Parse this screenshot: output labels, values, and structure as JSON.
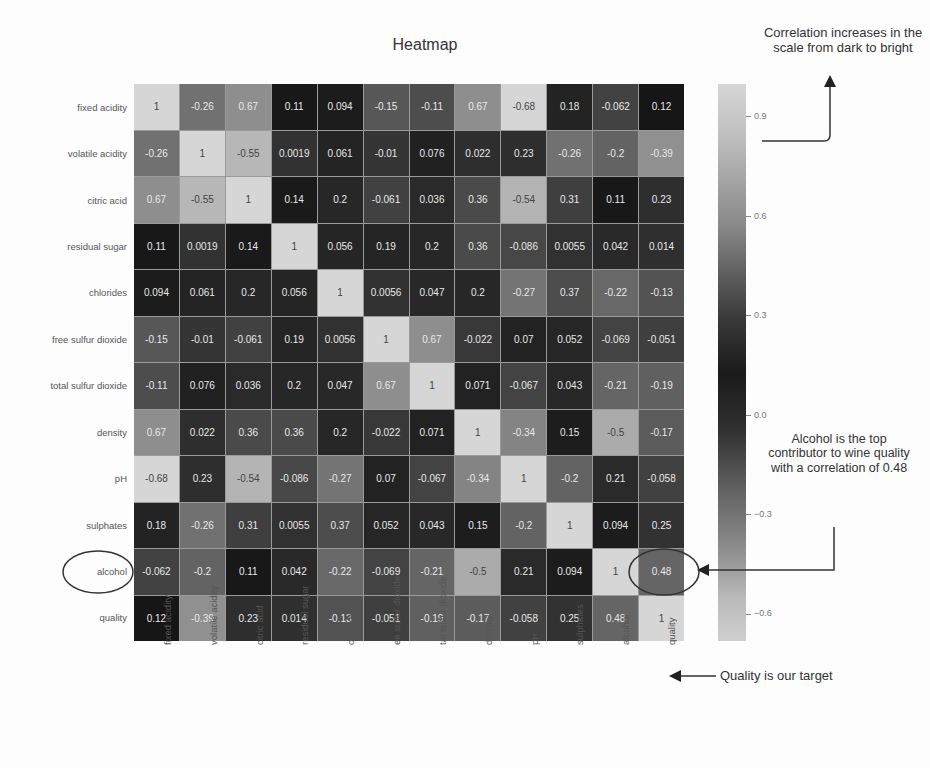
{
  "chart_data": {
    "type": "heatmap",
    "title": "Heatmap",
    "xlabel": "",
    "ylabel": "",
    "row_labels": [
      "fixed acidity",
      "volatile acidity",
      "citric acid",
      "residual sugar",
      "chlorides",
      "free sulfur dioxide",
      "total sulfur dioxide",
      "density",
      "pH",
      "sulphates",
      "alcohol",
      "quality"
    ],
    "col_labels": [
      "fixed acidity",
      "volatile acidity",
      "citric acid",
      "residual sugar",
      "chlorides",
      "ee sulfur dioxide",
      "tal sulfur dioxide",
      "density",
      "pH",
      "sulphates",
      "alcohol",
      "quality"
    ],
    "values": [
      [
        "1",
        "-0.26",
        "0.67",
        "0.11",
        "0.094",
        "-0.15",
        "-0.11",
        "0.67",
        "-0.68",
        "0.18",
        "-0.062",
        "0.12"
      ],
      [
        "-0.26",
        "1",
        "-0.55",
        "0.0019",
        "0.061",
        "-0.01",
        "0.076",
        "0.022",
        "0.23",
        "-0.26",
        "-0.2",
        "-0.39"
      ],
      [
        "0.67",
        "-0.55",
        "1",
        "0.14",
        "0.2",
        "-0.061",
        "0.036",
        "0.36",
        "-0.54",
        "0.31",
        "0.11",
        "0.23"
      ],
      [
        "0.11",
        "0.0019",
        "0.14",
        "1",
        "0.056",
        "0.19",
        "0.2",
        "0.36",
        "-0.086",
        "0.0055",
        "0.042",
        "0.014"
      ],
      [
        "0.094",
        "0.061",
        "0.2",
        "0.056",
        "1",
        "0.0056",
        "0.047",
        "0.2",
        "-0.27",
        "0.37",
        "-0.22",
        "-0.13"
      ],
      [
        "-0.15",
        "-0.01",
        "-0.061",
        "0.19",
        "0.0056",
        "1",
        "0.67",
        "-0.022",
        "0.07",
        "0.052",
        "-0.069",
        "-0.051"
      ],
      [
        "-0.11",
        "0.076",
        "0.036",
        "0.2",
        "0.047",
        "0.67",
        "1",
        "0.071",
        "-0.067",
        "0.043",
        "-0.21",
        "-0.19"
      ],
      [
        "0.67",
        "0.022",
        "0.36",
        "0.36",
        "0.2",
        "-0.022",
        "0.071",
        "1",
        "-0.34",
        "0.15",
        "-0.5",
        "-0.17"
      ],
      [
        "-0.68",
        "0.23",
        "-0.54",
        "-0.086",
        "-0.27",
        "0.07",
        "-0.067",
        "-0.34",
        "1",
        "-0.2",
        "0.21",
        "-0.058"
      ],
      [
        "0.18",
        "-0.26",
        "0.31",
        "0.0055",
        "0.37",
        "0.052",
        "0.043",
        "0.15",
        "-0.2",
        "1",
        "0.094",
        "0.25"
      ],
      [
        "-0.062",
        "-0.2",
        "0.11",
        "0.042",
        "-0.22",
        "-0.069",
        "-0.21",
        "-0.5",
        "0.21",
        "0.094",
        "1",
        "0.48"
      ],
      [
        "0.12",
        "-0.39",
        "0.23",
        "0.014",
        "-0.13",
        "-0.051",
        "-0.19",
        "-0.17",
        "-0.058",
        "0.25",
        "0.48",
        "1"
      ]
    ],
    "colorbar": {
      "ticks": [
        "0.9",
        "0.6",
        "0.3",
        "0.0",
        "−0.3",
        "−0.6"
      ],
      "range": [
        -0.68,
        1.0
      ],
      "colormap": "grayscale diverging (light at extremes, dark near 0.15)"
    },
    "annotations": [
      "Correlation increases in the scale from dark to bright",
      "Alcohol is the top contributor to wine quality with a correlation of 0.48",
      "Quality is our target"
    ]
  },
  "annotations": {
    "top_right": "Correlation increases in the scale from dark to bright",
    "right_middle": "Alcohol is the top contributor to wine quality with a correlation of 0.48",
    "bottom_right": "Quality is our target"
  }
}
